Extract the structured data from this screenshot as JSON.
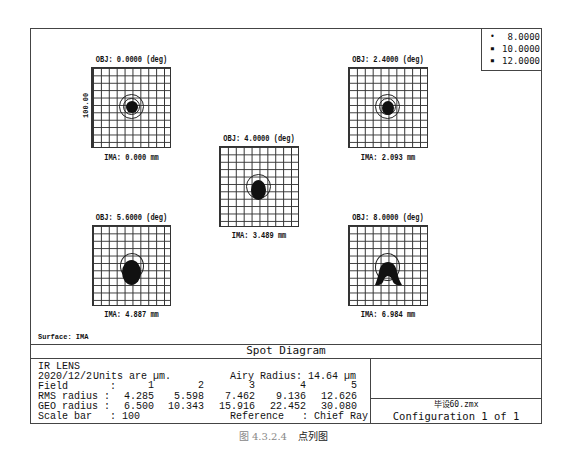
{
  "legend": {
    "items": [
      {
        "marker": "•",
        "label": "8.0000"
      },
      {
        "marker": "▪",
        "label": "10.0000"
      },
      {
        "marker": "▪",
        "label": "12.0000"
      }
    ]
  },
  "plots": [
    {
      "field": 1,
      "obj_label": "OBJ: 0.0000 (deg)",
      "ima_label": "IMA: 0.000 mm",
      "spot_shape": "round"
    },
    {
      "field": 2,
      "obj_label": "OBJ: 2.4000 (deg)",
      "ima_label": "IMA: 2.093 mm",
      "spot_shape": "round"
    },
    {
      "field": 3,
      "obj_label": "OBJ: 4.0000 (deg)",
      "ima_label": "IMA: 3.489 mm",
      "spot_shape": "round-shifted"
    },
    {
      "field": 4,
      "obj_label": "OBJ: 5.6000 (deg)",
      "ima_label": "IMA: 4.887 mm",
      "spot_shape": "oval-shifted"
    },
    {
      "field": 5,
      "obj_label": "OBJ: 8.0000 (deg)",
      "ima_label": "IMA: 6.984 mm",
      "spot_shape": "coma-arch"
    }
  ],
  "scale_bar_label": "100.00",
  "surface_label": "Surface: IMA",
  "diagram_title": "Spot Diagram",
  "info": {
    "lens_name": "IR LENS",
    "date": "2020/12/2",
    "units": "Units are µm.",
    "airy_radius": "Airy Radius: 14.64 µm",
    "field_label": "Field       :",
    "rms_label": "RMS radius :",
    "geo_label": "GEO radius :",
    "scale_bar": "Scale bar   : 100",
    "reference": "Reference   : Chief Ray",
    "fields": [
      "1",
      "2",
      "3",
      "4",
      "5"
    ],
    "rms_radius": [
      "4.285",
      "5.598",
      "7.462",
      "9.136",
      "12.626"
    ],
    "geo_radius": [
      "6.500",
      "10.343",
      "15.916",
      "22.452",
      "30.080"
    ]
  },
  "file_name": "毕设60.zmx",
  "configuration": "Configuration 1 of 1",
  "caption": {
    "number": "图 4.3.2.4",
    "text": "点列图"
  }
}
